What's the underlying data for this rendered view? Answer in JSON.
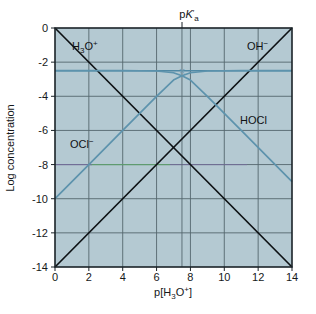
{
  "figure": {
    "background_color": "#ffffff",
    "plot_background_color": "#b4c9d2",
    "grid_color": "#55666e",
    "frame_color": "#1b2328",
    "acid_base_line_color": "#0d1114",
    "species_line_color": "#5d93ad",
    "total_conc_line_color": "#4f88a4"
  },
  "axes": {
    "x_label_prefix": "p[H",
    "x_label_sub": "3",
    "x_label_mid": "O",
    "x_label_sup": "+",
    "x_label_suffix": "]",
    "x_label_plain": "p[H3O+]",
    "y_label": "Log concentration",
    "x_ticks": [
      "0",
      "2",
      "4",
      "6",
      "8",
      "10",
      "12",
      "14"
    ],
    "y_ticks": [
      "0",
      "-2",
      "-4",
      "-6",
      "-8",
      "-10",
      "-12",
      "-14"
    ],
    "xlim": [
      0,
      14
    ],
    "ylim": [
      -14,
      0
    ]
  },
  "annotations": {
    "pka_label_p": "p",
    "pka_label_k": "K",
    "pka_label_prime": "′",
    "pka_label_sub": "a",
    "pka_label_plain": "pK′a",
    "pka_x_value": 7.5,
    "intersection_marker": "×"
  },
  "series_labels": {
    "hydronium": {
      "main": "H",
      "sub": "3",
      "mid": "O",
      "sup": "+",
      "plain": "H3O+"
    },
    "hydroxide": {
      "main": "OH",
      "sup": "−",
      "plain": "OH−"
    },
    "hypochlorite": {
      "main": "OCl",
      "sup": "−",
      "plain": "OCl−"
    },
    "hypochlorous_acid": {
      "main": "HOCl",
      "plain": "HOCl"
    }
  },
  "chart_data": {
    "type": "line",
    "title": "",
    "subtitle": "",
    "xlabel": "p[H3O+]",
    "ylabel": "Log concentration",
    "xlim": [
      0,
      14
    ],
    "ylim": [
      -14,
      0
    ],
    "xticks": [
      0,
      2,
      4,
      6,
      8,
      10,
      12,
      14
    ],
    "yticks": [
      0,
      -2,
      -4,
      -6,
      -8,
      -10,
      -12,
      -14
    ],
    "grid": true,
    "legend": "inline-labels",
    "parameters": {
      "pKa": 7.5,
      "log_CT": -2.5,
      "pKw": 14
    },
    "series": [
      {
        "name": "H3O+",
        "color": "#0d1114",
        "label_position": {
          "x": 1.6,
          "y": -0.9
        },
        "points": [
          {
            "x": 0,
            "y": 0
          },
          {
            "x": 14,
            "y": -14
          }
        ]
      },
      {
        "name": "OH-",
        "color": "#0d1114",
        "label_position": {
          "x": 11.9,
          "y": -0.9
        },
        "points": [
          {
            "x": 0,
            "y": -14
          },
          {
            "x": 14,
            "y": 0
          }
        ]
      },
      {
        "name": "OCl-",
        "color": "#5d93ad",
        "label_position": {
          "x": 2.1,
          "y": -7.1
        },
        "points": [
          {
            "x": 0,
            "y": -10.0
          },
          {
            "x": 2,
            "y": -8.0
          },
          {
            "x": 4,
            "y": -6.0
          },
          {
            "x": 6,
            "y": -4.0
          },
          {
            "x": 7.0,
            "y": -3.05
          },
          {
            "x": 7.5,
            "y": -2.8
          },
          {
            "x": 8.0,
            "y": -2.62
          },
          {
            "x": 9.0,
            "y": -2.52
          },
          {
            "x": 11.0,
            "y": -2.5
          },
          {
            "x": 14,
            "y": -2.5
          }
        ]
      },
      {
        "name": "HOCl",
        "color": "#5d93ad",
        "label_position": {
          "x": 10.6,
          "y": -5.3
        },
        "points": [
          {
            "x": 0,
            "y": -2.5
          },
          {
            "x": 4,
            "y": -2.5
          },
          {
            "x": 6.0,
            "y": -2.52
          },
          {
            "x": 7.0,
            "y": -2.62
          },
          {
            "x": 7.5,
            "y": -2.8
          },
          {
            "x": 8.0,
            "y": -3.05
          },
          {
            "x": 9.0,
            "y": -4.0
          },
          {
            "x": 11.0,
            "y": -6.0
          },
          {
            "x": 14,
            "y": -9.0
          }
        ]
      }
    ],
    "markers": [
      {
        "symbol": "×",
        "x": 7.5,
        "y": -2.5,
        "name": "pka-intersection-marker"
      }
    ],
    "horizontal_reference_lines": [
      {
        "y": -2.5,
        "color": "#4f88a4",
        "name": "total-concentration-line"
      }
    ],
    "vertical_reference_lines": [
      {
        "x": 7.5,
        "color": "#55666e",
        "name": "pka-indicator-line"
      }
    ]
  }
}
